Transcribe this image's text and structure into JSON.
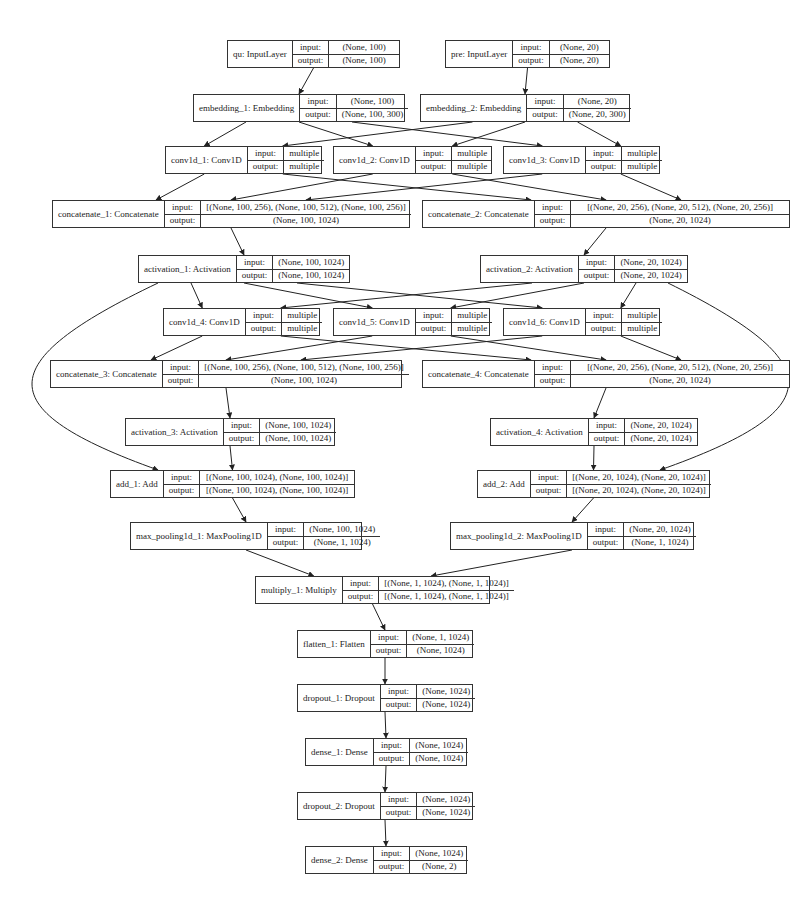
{
  "diagram": {
    "type": "keras-model-plot",
    "labels": {
      "input": "input:",
      "output": "output:"
    },
    "nodes": [
      {
        "id": "qu",
        "name": "qu: InputLayer",
        "input": "(None, 100)",
        "output": "(None, 100)",
        "box": [
          227,
          40,
          173,
          28
        ]
      },
      {
        "id": "pre",
        "name": "pre: InputLayer",
        "input": "(None, 20)",
        "output": "(None, 20)",
        "box": [
          445,
          40,
          165,
          28
        ]
      },
      {
        "id": "embedding_1",
        "name": "embedding_1: Embedding",
        "input": "(None, 100)",
        "output": "(None, 100, 300)",
        "box": [
          193,
          94,
          212,
          28
        ]
      },
      {
        "id": "embedding_2",
        "name": "embedding_2: Embedding",
        "input": "(None, 20)",
        "output": "(None, 20, 300)",
        "box": [
          420,
          94,
          210,
          28
        ]
      },
      {
        "id": "conv1d_1",
        "name": "conv1d_1: Conv1D",
        "input": "multiple",
        "output": "multiple",
        "box": [
          165,
          146,
          157,
          28
        ]
      },
      {
        "id": "conv1d_2",
        "name": "conv1d_2: Conv1D",
        "input": "multiple",
        "output": "multiple",
        "box": [
          333,
          146,
          159,
          28
        ]
      },
      {
        "id": "conv1d_3",
        "name": "conv1d_3: Conv1D",
        "input": "multiple",
        "output": "multiple",
        "box": [
          503,
          146,
          157,
          28
        ]
      },
      {
        "id": "concatenate_1",
        "name": "concatenate_1: Concatenate",
        "input": "[(None, 100, 256), (None, 100, 512), (None, 100, 256)]",
        "output": "(None, 100, 1024)",
        "box": [
          52,
          200,
          358,
          28
        ]
      },
      {
        "id": "concatenate_2",
        "name": "concatenate_2: Concatenate",
        "input": "[(None, 20, 256), (None, 20, 512), (None, 20, 256)]",
        "output": "(None, 20, 1024)",
        "box": [
          422,
          200,
          368,
          28
        ]
      },
      {
        "id": "activation_1",
        "name": "activation_1: Activation",
        "input": "(None, 100, 1024)",
        "output": "(None, 100, 1024)",
        "box": [
          138,
          255,
          212,
          28
        ]
      },
      {
        "id": "activation_2",
        "name": "activation_2: Activation",
        "input": "(None, 20, 1024)",
        "output": "(None, 20, 1024)",
        "box": [
          480,
          255,
          208,
          28
        ]
      },
      {
        "id": "conv1d_4",
        "name": "conv1d_4: Conv1D",
        "input": "multiple",
        "output": "multiple",
        "box": [
          163,
          308,
          157,
          28
        ]
      },
      {
        "id": "conv1d_5",
        "name": "conv1d_5: Conv1D",
        "input": "multiple",
        "output": "multiple",
        "box": [
          333,
          308,
          157,
          28
        ]
      },
      {
        "id": "conv1d_6",
        "name": "conv1d_6: Conv1D",
        "input": "multiple",
        "output": "multiple",
        "box": [
          503,
          308,
          157,
          28
        ]
      },
      {
        "id": "concatenate_3",
        "name": "concatenate_3: Concatenate",
        "input": "[(None, 100, 256), (None, 100, 512), (None, 100, 256)]",
        "output": "(None, 100, 1024)",
        "box": [
          50,
          360,
          352,
          28
        ]
      },
      {
        "id": "concatenate_4",
        "name": "concatenate_4: Concatenate",
        "input": "[(None, 20, 256), (None, 20, 512), (None, 20, 256)]",
        "output": "(None, 20, 1024)",
        "box": [
          422,
          360,
          368,
          28
        ]
      },
      {
        "id": "activation_3",
        "name": "activation_3: Activation",
        "input": "(None, 100, 1024)",
        "output": "(None, 100, 1024)",
        "box": [
          125,
          418,
          210,
          28
        ]
      },
      {
        "id": "activation_4",
        "name": "activation_4: Activation",
        "input": "(None, 20, 1024)",
        "output": "(None, 20, 1024)",
        "box": [
          490,
          418,
          208,
          28
        ]
      },
      {
        "id": "add_1",
        "name": "add_1: Add",
        "input": "[(None, 100, 1024), (None, 100, 1024)]",
        "output": "[(None, 100, 1024), (None, 100, 1024)]",
        "box": [
          110,
          470,
          245,
          28
        ]
      },
      {
        "id": "add_2",
        "name": "add_2: Add",
        "input": "[(None, 20, 1024), (None, 20, 1024)]",
        "output": "[(None, 20, 1024), (None, 20, 1024)]",
        "box": [
          477,
          470,
          233,
          28
        ]
      },
      {
        "id": "max_pooling1d_1",
        "name": "max_pooling1d_1: MaxPooling1D",
        "input": "(None, 100, 1024)",
        "output": "(None, 1, 1024)",
        "box": [
          130,
          522,
          232,
          28
        ]
      },
      {
        "id": "max_pooling1d_2",
        "name": "max_pooling1d_2: MaxPooling1D",
        "input": "(None, 20, 1024)",
        "output": "(None, 1, 1024)",
        "box": [
          450,
          522,
          244,
          28
        ]
      },
      {
        "id": "multiply_1",
        "name": "multiply_1: Multiply",
        "input": "[(None, 1, 1024), (None, 1, 1024)]",
        "output": "[(None, 1, 1024), (None, 1, 1024)]",
        "box": [
          255,
          576,
          235,
          28
        ]
      },
      {
        "id": "flatten_1",
        "name": "flatten_1: Flatten",
        "input": "(None, 1, 1024)",
        "output": "(None, 1024)",
        "box": [
          297,
          630,
          176,
          28
        ]
      },
      {
        "id": "dropout_1",
        "name": "dropout_1: Dropout",
        "input": "(None, 1024)",
        "output": "(None, 1024)",
        "box": [
          297,
          684,
          176,
          28
        ]
      },
      {
        "id": "dense_1",
        "name": "dense_1: Dense",
        "input": "(None, 1024)",
        "output": "(None, 1024)",
        "box": [
          305,
          738,
          162,
          28
        ]
      },
      {
        "id": "dropout_2",
        "name": "dropout_2: Dropout",
        "input": "(None, 1024)",
        "output": "(None, 1024)",
        "box": [
          297,
          792,
          176,
          28
        ]
      },
      {
        "id": "dense_2",
        "name": "dense_2: Dense",
        "input": "(None, 1024)",
        "output": "(None, 2)",
        "box": [
          305,
          846,
          162,
          28
        ]
      }
    ],
    "edges": [
      [
        "qu",
        "embedding_1"
      ],
      [
        "pre",
        "embedding_2"
      ],
      [
        "embedding_1",
        "conv1d_1"
      ],
      [
        "embedding_1",
        "conv1d_2"
      ],
      [
        "embedding_1",
        "conv1d_3"
      ],
      [
        "embedding_2",
        "conv1d_1"
      ],
      [
        "embedding_2",
        "conv1d_2"
      ],
      [
        "embedding_2",
        "conv1d_3"
      ],
      [
        "conv1d_1",
        "concatenate_1"
      ],
      [
        "conv1d_2",
        "concatenate_1"
      ],
      [
        "conv1d_3",
        "concatenate_1"
      ],
      [
        "conv1d_1",
        "concatenate_2"
      ],
      [
        "conv1d_2",
        "concatenate_2"
      ],
      [
        "conv1d_3",
        "concatenate_2"
      ],
      [
        "concatenate_1",
        "activation_1"
      ],
      [
        "concatenate_2",
        "activation_2"
      ],
      [
        "activation_1",
        "conv1d_4"
      ],
      [
        "activation_1",
        "conv1d_5"
      ],
      [
        "activation_1",
        "conv1d_6"
      ],
      [
        "activation_2",
        "conv1d_4"
      ],
      [
        "activation_2",
        "conv1d_5"
      ],
      [
        "activation_2",
        "conv1d_6"
      ],
      [
        "conv1d_4",
        "concatenate_3"
      ],
      [
        "conv1d_5",
        "concatenate_3"
      ],
      [
        "conv1d_6",
        "concatenate_3"
      ],
      [
        "conv1d_4",
        "concatenate_4"
      ],
      [
        "conv1d_5",
        "concatenate_4"
      ],
      [
        "conv1d_6",
        "concatenate_4"
      ],
      [
        "concatenate_3",
        "activation_3"
      ],
      [
        "concatenate_4",
        "activation_4"
      ],
      [
        "activation_1",
        "add_1",
        "curve-left"
      ],
      [
        "activation_3",
        "add_1"
      ],
      [
        "activation_2",
        "add_2",
        "curve-right"
      ],
      [
        "activation_4",
        "add_2"
      ],
      [
        "add_1",
        "max_pooling1d_1"
      ],
      [
        "add_2",
        "max_pooling1d_2"
      ],
      [
        "max_pooling1d_1",
        "multiply_1"
      ],
      [
        "max_pooling1d_2",
        "multiply_1"
      ],
      [
        "multiply_1",
        "flatten_1"
      ],
      [
        "flatten_1",
        "dropout_1"
      ],
      [
        "dropout_1",
        "dense_1"
      ],
      [
        "dense_1",
        "dropout_2"
      ],
      [
        "dropout_2",
        "dense_2"
      ]
    ]
  }
}
